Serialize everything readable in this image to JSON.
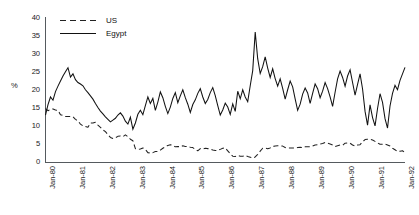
{
  "chart_data": {
    "type": "line",
    "title": "",
    "xlabel": "",
    "ylabel": "%",
    "ylim": [
      0,
      40
    ],
    "ytick_values": [
      0,
      5,
      10,
      15,
      20,
      25,
      30,
      35,
      40
    ],
    "grid": false,
    "legend_position": "top-left",
    "xtick_labels": [
      "Jan-80",
      "Jan-81",
      "Jan-82",
      "Jan-83",
      "Jan-84",
      "Jan-85",
      "Jan-86",
      "Jan-87",
      "Jan-88",
      "Jan-89",
      "Jan-90",
      "Jan-91",
      "Jan-92"
    ],
    "x_start": "Jan-80",
    "x_end": "Jan-92",
    "series": [
      {
        "name": "US",
        "style": "dashed",
        "color": "#222222",
        "values": [
          14.8,
          14.2,
          14.6,
          14.7,
          14.4,
          14.3,
          13.1,
          12.9,
          12.6,
          12.6,
          12.6,
          12.5,
          11.8,
          11.4,
          10.5,
          10.0,
          9.8,
          9.6,
          10.8,
          10.8,
          11.0,
          10.2,
          9.6,
          8.9,
          8.4,
          7.6,
          6.8,
          6.5,
          6.7,
          7.1,
          7.2,
          7.0,
          7.5,
          7.0,
          6.3,
          5.9,
          3.7,
          3.5,
          3.6,
          3.9,
          3.5,
          2.6,
          2.5,
          2.6,
          2.9,
          2.9,
          3.3,
          3.8,
          4.2,
          4.6,
          4.8,
          4.6,
          4.2,
          4.3,
          4.2,
          4.5,
          4.3,
          4.3,
          4.1,
          4.0,
          3.5,
          3.1,
          3.7,
          3.6,
          3.8,
          3.7,
          3.6,
          3.3,
          3.2,
          3.2,
          3.5,
          3.8,
          3.9,
          3.1,
          2.3,
          1.6,
          1.5,
          1.8,
          1.6,
          1.6,
          1.8,
          1.5,
          1.3,
          1.1,
          1.4,
          2.1,
          3.0,
          3.8,
          3.9,
          3.7,
          3.9,
          4.3,
          4.4,
          4.5,
          4.5,
          4.4,
          4.0,
          3.9,
          3.9,
          3.9,
          3.9,
          4.0,
          4.1,
          4.0,
          4.2,
          4.2,
          4.2,
          4.4,
          4.7,
          4.8,
          5.0,
          5.1,
          5.4,
          5.2,
          5.0,
          4.7,
          4.3,
          4.5,
          4.7,
          4.6,
          5.2,
          5.3,
          5.2,
          4.7,
          4.4,
          4.7,
          4.8,
          5.6,
          6.2,
          6.3,
          6.3,
          6.1,
          5.7,
          5.3,
          4.9,
          4.9,
          5.0,
          4.7,
          4.4,
          3.8,
          3.4,
          2.9,
          3.0,
          3.1,
          2.6
        ]
      },
      {
        "name": "Egypt",
        "style": "solid",
        "color": "#111111",
        "values": [
          13.0,
          15.9,
          18.0,
          17.1,
          19.5,
          21.0,
          22.4,
          23.8,
          25.0,
          26.1,
          23.5,
          24.4,
          22.8,
          22.0,
          21.6,
          21.1,
          20.0,
          19.2,
          18.3,
          17.4,
          16.2,
          15.1,
          14.1,
          13.3,
          12.5,
          11.8,
          11.1,
          11.6,
          12.1,
          13.0,
          13.6,
          12.7,
          11.3,
          10.5,
          12.4,
          9.1,
          10.8,
          13.2,
          14.3,
          13.1,
          15.6,
          18.0,
          16.2,
          17.6,
          14.3,
          16.6,
          19.4,
          17.8,
          15.4,
          13.4,
          15.2,
          17.6,
          19.2,
          16.4,
          18.3,
          20.0,
          17.8,
          16.0,
          13.7,
          15.9,
          17.2,
          19.0,
          20.3,
          18.0,
          16.2,
          17.3,
          19.2,
          20.6,
          18.4,
          15.6,
          13.0,
          14.4,
          16.3,
          15.2,
          13.2,
          16.1,
          14.0,
          19.6,
          17.5,
          20.0,
          18.0,
          16.7,
          21.1,
          25.3,
          36.0,
          28.6,
          24.5,
          26.4,
          29.1,
          26.0,
          23.4,
          25.8,
          23.1,
          21.0,
          23.0,
          20.4,
          17.4,
          20.0,
          22.4,
          20.8,
          17.5,
          14.3,
          16.0,
          18.8,
          20.5,
          19.1,
          16.2,
          19.0,
          21.6,
          20.3,
          17.8,
          19.6,
          22.0,
          20.3,
          18.0,
          15.4,
          19.3,
          23.0,
          25.2,
          23.4,
          21.0,
          23.8,
          25.5,
          22.0,
          18.5,
          21.5,
          24.4,
          20.2,
          14.0,
          10.2,
          15.8,
          12.3,
          10.0,
          14.8,
          18.9,
          16.5,
          12.0,
          9.4,
          15.5,
          19.0,
          21.2,
          20.0,
          22.6,
          24.4,
          26.2
        ]
      }
    ]
  },
  "legend": {
    "items": [
      {
        "label": "US",
        "style": "dashed"
      },
      {
        "label": "Egypt",
        "style": "solid"
      }
    ]
  }
}
